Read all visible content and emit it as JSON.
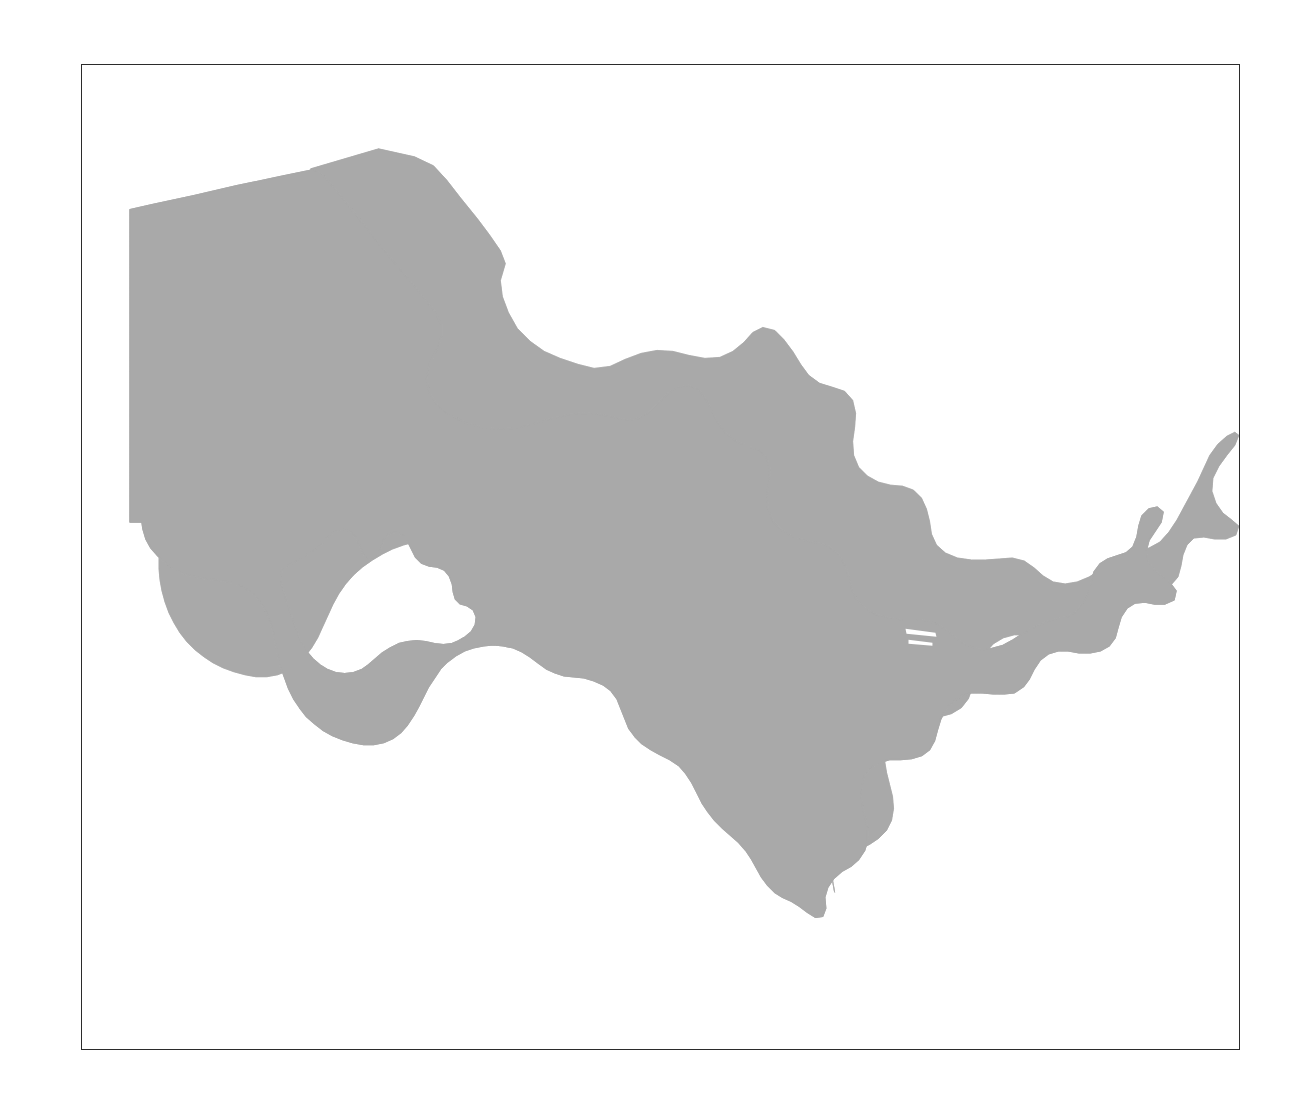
{
  "figure": {
    "domain": "Map",
    "title": "Uzbekistan",
    "subtitle": "",
    "caption": "",
    "background_color": "#ffffff",
    "frame": {
      "visible": true,
      "color": "#2b2b2b",
      "line_width_px": 1,
      "x": 81,
      "y": 64,
      "width": 1159,
      "height": 986
    }
  },
  "map_data": {
    "type": "choropleth-silhouette",
    "projection": "equirectangular",
    "region_name": "Uzbekistan",
    "region_count": 1,
    "fill_color": "#a9a9a9",
    "stroke_color": "#a9a9a9",
    "texture": "noise-dither",
    "holes": [
      {
        "name": "Aral Sea",
        "description": "interior white void in the northwest (Karakalpakstan)"
      }
    ],
    "features": [
      {
        "name": "northwest-plateau",
        "description": "Ustyurt plateau straight western border"
      },
      {
        "name": "aral-sea-void",
        "description": "white inland sea cutout"
      },
      {
        "name": "central-body",
        "description": "main landmass tapering southeast"
      },
      {
        "name": "fergana-valley",
        "description": "eastern lobe extending to the far right"
      },
      {
        "name": "surkhandarya-tail",
        "description": "southern pointed tail"
      },
      {
        "name": "enclave-sliver",
        "description": "thin white slivers near the Fergana neck"
      }
    ],
    "bounds_px": {
      "x_min": 128,
      "y_min": 168,
      "x_max": 1192,
      "y_max": 893
    },
    "labels": [],
    "legend": {
      "visible": false,
      "entries": []
    },
    "gridlines": {
      "visible": false
    },
    "axis_ticks": {
      "visible": false
    }
  },
  "colors": {
    "land": "#a9a9a9",
    "water": "#ffffff",
    "frame": "#2b2b2b",
    "background": "#ffffff"
  }
}
